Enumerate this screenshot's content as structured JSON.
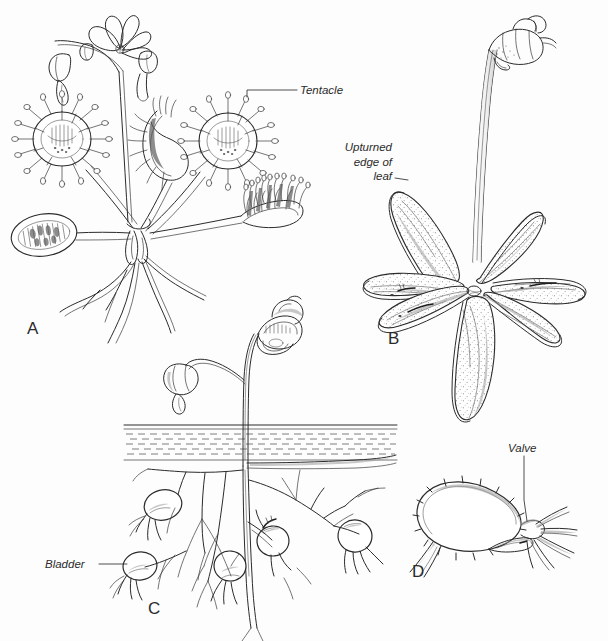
{
  "figure": {
    "background_color": "#fdfdfd",
    "ink_color": "#2b2b2b",
    "width": 608,
    "height": 641
  },
  "panels": [
    {
      "letter": "A",
      "subject": "sundew-plant",
      "description": "Sundew (Drosera) rosette with round tentacle-covered leaves, flower stalk and roots"
    },
    {
      "letter": "B",
      "subject": "butterwort-plant",
      "description": "Butterwort (Pinguicula) rosette of six stippled leaves with upturned edges and a single flower on a tall stalk"
    },
    {
      "letter": "C",
      "subject": "bladderwort-plant",
      "description": "Bladderwort (Utricularia) with flower above the water line and submerged branching stems bearing bladders"
    },
    {
      "letter": "D",
      "subject": "bladder-detail",
      "description": "Enlarged single bladder showing bristles and the entrance valve"
    }
  ],
  "callouts": [
    {
      "id": "tentacle",
      "label": "Tentacle",
      "panel": "A"
    },
    {
      "id": "upturned-edge-of-leaf",
      "label": "Upturned\nedge of\nleaf",
      "panel": "B"
    },
    {
      "id": "bladder",
      "label": "Bladder",
      "panel": "C"
    },
    {
      "id": "valve",
      "label": "Valve",
      "panel": "D"
    }
  ]
}
